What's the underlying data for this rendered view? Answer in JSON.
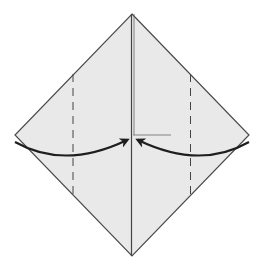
{
  "diagram": {
    "type": "origami-fold-step",
    "colors": {
      "paper_fill": "#e9e9e9",
      "edge_stroke": "#4a4a4a",
      "arrow_stroke": "#1e1e1e",
      "crease_stroke": "#555555",
      "background": "#ffffff"
    },
    "elements": {
      "paper": "diamond-paper",
      "center_crease": "vertical-center-crease",
      "valley_folds": [
        "left-valley-fold",
        "right-valley-fold"
      ],
      "arrows": [
        "left-fold-arrow",
        "right-fold-arrow"
      ],
      "reference_line": "horizontal-center-reference"
    }
  }
}
